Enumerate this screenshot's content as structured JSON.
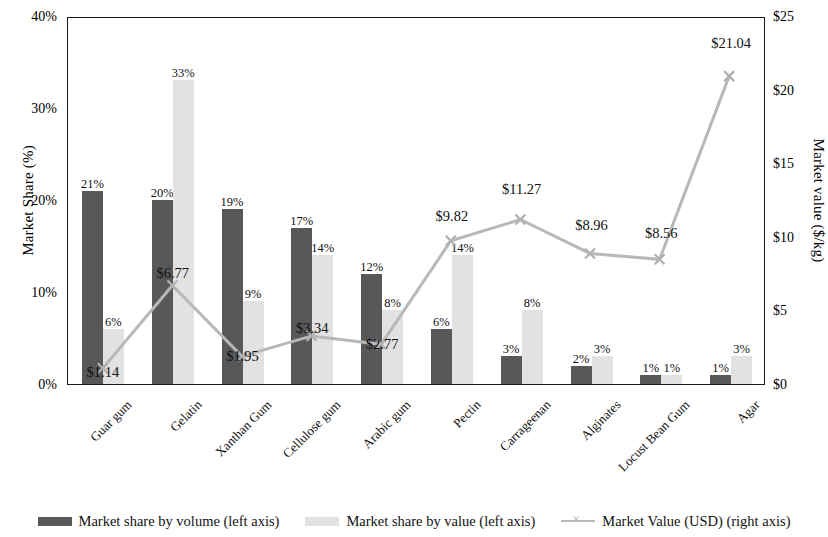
{
  "chart_data": {
    "type": "bar",
    "title": "",
    "xlabel": "",
    "ylabel": "Market Share (%)",
    "y2label": "Market value ($/kg)",
    "ylim": [
      0,
      40
    ],
    "y2lim": [
      0,
      25
    ],
    "yticks": [
      "0%",
      "10%",
      "20%",
      "30%",
      "40%"
    ],
    "y2ticks": [
      "$0",
      "$5",
      "$10",
      "$15",
      "$20",
      "$25"
    ],
    "grid": false,
    "legend_position": "bottom",
    "categories": [
      "Guar gum",
      "Gelatin",
      "Xanthan Gum",
      "Cellulose gum",
      "Arabic gum",
      "Pectin",
      "Carrageenan",
      "Alginates",
      "Locust Bean Gum",
      "Agar"
    ],
    "series": [
      {
        "name": "Market share by volume (left axis)",
        "type": "bar",
        "axis": "left",
        "color": "#585858",
        "values": [
          21,
          20,
          19,
          17,
          12,
          6,
          3,
          2,
          1,
          1
        ],
        "labels": [
          "21%",
          "20%",
          "19%",
          "17%",
          "12%",
          "6%",
          "3%",
          "2%",
          "1%",
          "1%"
        ]
      },
      {
        "name": "Market share by value (left axis)",
        "type": "bar",
        "axis": "left",
        "color": "#e2e2e2",
        "values": [
          6,
          33,
          9,
          14,
          8,
          14,
          8,
          3,
          1,
          3
        ],
        "labels": [
          "6%",
          "33%",
          "9%",
          "14%",
          "8%",
          "14%",
          "8%",
          "3%",
          "1%",
          "3%"
        ]
      },
      {
        "name": "Market Value (USD) (right axis)",
        "type": "line",
        "axis": "right",
        "color": "#b8b8b8",
        "marker": "x",
        "values": [
          1.14,
          6.77,
          1.95,
          3.34,
          2.77,
          9.82,
          11.27,
          8.96,
          8.56,
          21.04
        ],
        "labels": [
          "$1.14",
          "$6.77",
          "$1.95",
          "$3.34",
          "$2.77",
          "$9.82",
          "$11.27",
          "$8.96",
          "$8.56",
          "$21.04"
        ]
      }
    ]
  },
  "legend": {
    "items": [
      {
        "label": "Market share by volume (left axis)",
        "swatch": "vol"
      },
      {
        "label": "Market share by value (left axis)",
        "swatch": "val"
      },
      {
        "label": "Market Value (USD) (right axis)",
        "swatch": "line"
      }
    ]
  }
}
